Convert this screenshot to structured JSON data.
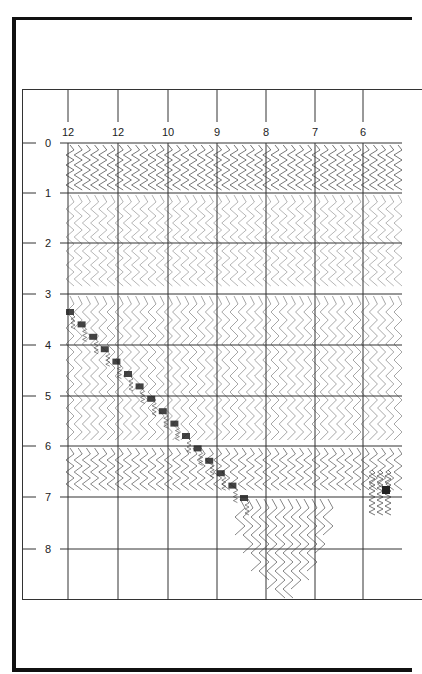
{
  "figure": {
    "column_labels": [
      "12",
      "12",
      "10",
      "9",
      "8",
      "7",
      "6"
    ],
    "row_labels": [
      "0",
      "1",
      "2",
      "3",
      "4",
      "5",
      "6",
      "7",
      "8"
    ],
    "column_x": [
      68,
      118,
      168,
      217,
      266,
      315,
      363
    ],
    "row_y": [
      143,
      193,
      243,
      294,
      345,
      396,
      446,
      497,
      549
    ]
  },
  "diagram_description": "Scanned trace diagram: grid with column headers 12,12,10,9,8,7,6 and row scale 0-8, filled with zigzag wiggle traces from 0 to 7, diagonal dark event from about 3.3 at column 1 to 7 near column 5, traces extending to 8+ beneath columns 7-8",
  "colors": {
    "ink": "#222222",
    "frame": "#111111",
    "background": "#ffffff"
  }
}
